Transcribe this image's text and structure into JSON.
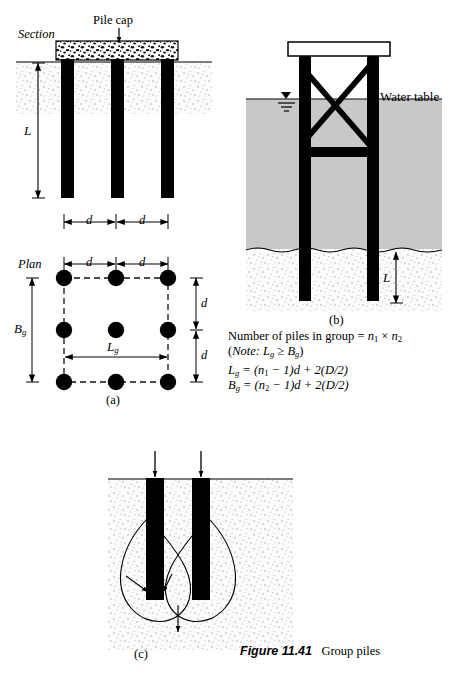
{
  "figure": {
    "caption_label": "Figure 11.41",
    "caption_text": "Group piles"
  },
  "panel_a": {
    "section_label": "Section",
    "plan_label": "Plan",
    "pile_cap_label": "Pile cap",
    "depth_label": "L",
    "spacing_label_1": "d",
    "spacing_label_2": "d",
    "plan_spacing_label_1": "d",
    "plan_spacing_label_2": "d",
    "plan_vert_spacing_1": "d",
    "plan_vert_spacing_2": "d",
    "width_label": "B",
    "width_label_sub": "g",
    "length_label": "L",
    "length_label_sub": "g",
    "panel_tag": "(a)",
    "pile_count_rows": 3,
    "pile_count_cols": 3
  },
  "panel_b": {
    "water_table_label": "Water table",
    "depth_label": "L",
    "panel_tag": "(b)"
  },
  "panel_c": {
    "panel_tag": "(c)"
  },
  "notes": {
    "line1_a": "Number of piles in group = ",
    "line1_n1": "n",
    "line1_n1_sub": "1",
    "line1_times": " × ",
    "line1_n2": "n",
    "line1_n2_sub": "2",
    "line2_note": "Note:",
    "line2_body_L": "L",
    "line2_body_L_sub": "g",
    "line2_geq": " ≥ ",
    "line2_body_B": "B",
    "line2_body_B_sub": "g",
    "line2_close": ")",
    "line3_lhs": "L",
    "line3_lhs_sub": "g",
    "line3_rhs": " = (n",
    "line3_rhs_sub": "1",
    "line3_rhs_tail": " − 1)d + 2(D/2)",
    "line4_lhs": "B",
    "line4_lhs_sub": "g",
    "line4_rhs": " = (n",
    "line4_rhs_sub": "2",
    "line4_rhs_tail": " − 1)d + 2(D/2)"
  },
  "colors": {
    "ink": "#000000",
    "water_fill": "#c8c8c8",
    "soil_dot": "#9a9a9a",
    "soil_bg": "#fbfbfb",
    "dash_line": "#1a1a1a"
  }
}
